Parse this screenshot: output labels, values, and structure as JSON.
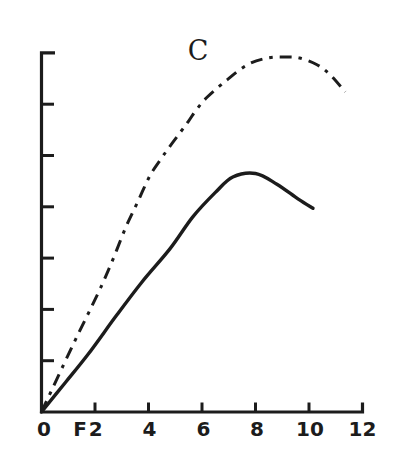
{
  "figure": {
    "background": "#ffffff",
    "ink_color": "#1c1c1c"
  },
  "chart_data": {
    "type": "line",
    "title": "",
    "grid": false,
    "legend": "none",
    "x_axis": {
      "xlim": [
        0,
        12
      ],
      "ticks": [
        2,
        4,
        6,
        8,
        10,
        12
      ],
      "labels": [
        {
          "text": "0",
          "x": 0,
          "dx": 2.5
        },
        {
          "text": "F2",
          "x": 2,
          "dx": -6
        },
        {
          "text": "4",
          "x": 4,
          "dx": 1
        },
        {
          "text": "6",
          "x": 6,
          "dx": 1.5
        },
        {
          "text": "8",
          "x": 8,
          "dx": 1.5
        },
        {
          "text": "10",
          "x": 10,
          "dx": 1
        },
        {
          "text": "12",
          "x": 12,
          "dx": 0
        }
      ]
    },
    "y_axis": {
      "ylim": [
        0,
        7
      ],
      "ticks": [
        1,
        2,
        3,
        4,
        5,
        6,
        7
      ],
      "tick_labels": []
    },
    "annotations": [
      {
        "text": "C",
        "x": 5.85,
        "y": 7.0
      }
    ],
    "series": [
      {
        "name": "C",
        "line_style": "dash-dot",
        "x": [
          0,
          1.15,
          2.1,
          2.65,
          3.15,
          3.6,
          4.05,
          4.45,
          4.8,
          5.2,
          5.5,
          5.8,
          6.2,
          6.95,
          7.7,
          8.45,
          9.1,
          9.65,
          10.3,
          10.8,
          11.35
        ],
        "y": [
          0,
          1.28,
          2.3,
          2.95,
          3.6,
          4.1,
          4.6,
          4.92,
          5.18,
          5.46,
          5.67,
          5.9,
          6.14,
          6.48,
          6.77,
          6.9,
          6.92,
          6.9,
          6.77,
          6.57,
          6.24
        ]
      },
      {
        "name": "solid curve",
        "line_style": "solid",
        "x": [
          0,
          0.9,
          1.75,
          2.8,
          3.75,
          4.8,
          5.65,
          6.5,
          7.15,
          8.0,
          8.8,
          9.6,
          10.15
        ],
        "y": [
          0,
          0.58,
          1.13,
          1.88,
          2.53,
          3.18,
          3.8,
          4.28,
          4.58,
          4.65,
          4.44,
          4.15,
          3.97
        ]
      }
    ]
  }
}
